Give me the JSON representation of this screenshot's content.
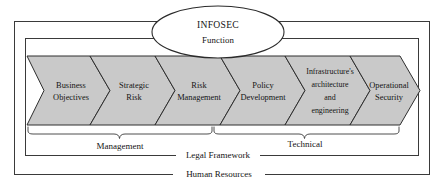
{
  "diagram": {
    "title_node": {
      "line1": "INFOSEC",
      "line2": "Function"
    },
    "stages": [
      {
        "id": "business-objectives",
        "lines": [
          "Business",
          "Objectives"
        ]
      },
      {
        "id": "strategic-risk",
        "lines": [
          "Strategic",
          "Risk"
        ]
      },
      {
        "id": "risk-management",
        "lines": [
          "Risk",
          "Management"
        ]
      },
      {
        "id": "policy-development",
        "lines": [
          "Policy",
          "Development"
        ]
      },
      {
        "id": "infrastructure-architecture-engineering",
        "lines": [
          "Infrastructure's",
          "architecture",
          "and",
          "engineering"
        ]
      },
      {
        "id": "operational-security",
        "lines": [
          "Operational",
          "Security"
        ]
      }
    ],
    "groupings": [
      {
        "id": "management",
        "label": "Management"
      },
      {
        "id": "technical",
        "label": "Technical"
      }
    ],
    "frames": [
      {
        "id": "legal-framework",
        "label": "Legal Framework"
      },
      {
        "id": "human-resources",
        "label": "Human Resources"
      }
    ],
    "colors": {
      "chevron_fill": "#c9c9c9",
      "stroke": "#2e2e2e",
      "frame_stroke": "#3a3a3a",
      "background": "#ffffff",
      "text": "#141414"
    }
  }
}
